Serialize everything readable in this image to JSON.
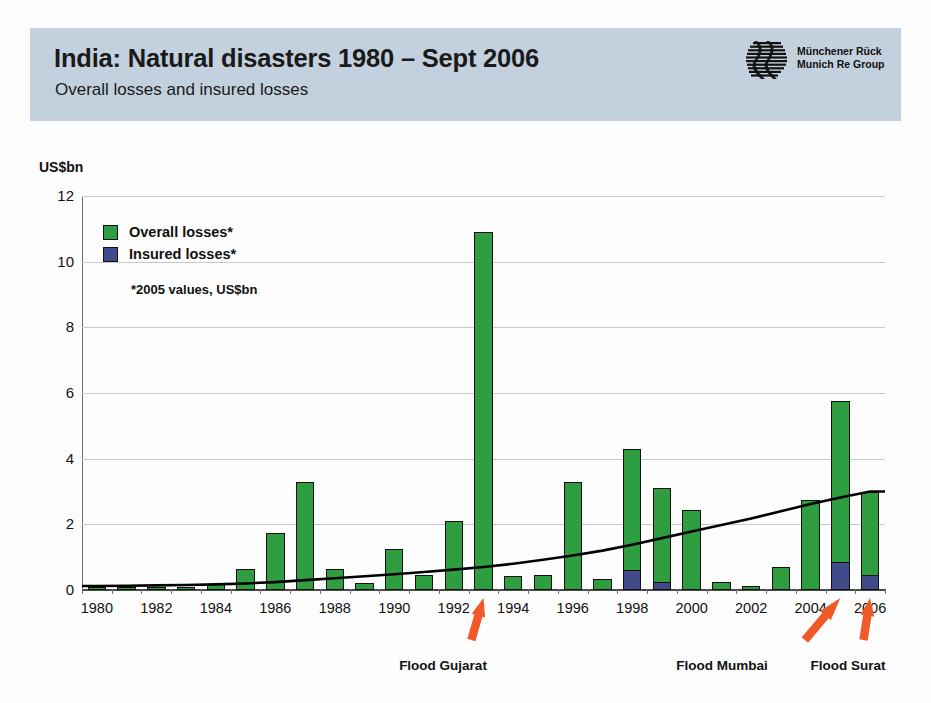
{
  "header": {
    "title": "India: Natural disasters 1980 – Sept 2006",
    "subtitle": "Overall losses and insured losses",
    "logo_line1": "Münchener Rück",
    "logo_line2": "Munich Re Group",
    "logo_icon": "munich-re-logo-icon",
    "band_color": "#c3d0de"
  },
  "legend": {
    "position": "inside-top-left",
    "items": [
      {
        "label": "Overall losses*",
        "color": "#2f9e41"
      },
      {
        "label": "Insured losses*",
        "color": "#414b8c"
      }
    ],
    "footnote": "*2005 values, US$bn"
  },
  "annotations": [
    {
      "label": "Flood Gujarat",
      "year": 1993,
      "color": "#f05a28"
    },
    {
      "label": "Flood Mumbai",
      "year": 2005,
      "color": "#f05a28"
    },
    {
      "label": "Flood Surat",
      "year": 2006,
      "color": "#f05a28"
    }
  ],
  "chart_data": {
    "type": "bar",
    "title": "India: Natural disasters 1980 – Sept 2006",
    "subtitle": "Overall losses and insured losses",
    "xlabel": "",
    "ylabel": "US$bn",
    "ylim": [
      0,
      12
    ],
    "yticks": [
      0,
      2,
      4,
      6,
      8,
      10,
      12
    ],
    "ytick_labels": [
      "0",
      "2",
      "4",
      "6",
      "8",
      "10",
      "12"
    ],
    "grid": true,
    "stacked": true,
    "categories": [
      1980,
      1981,
      1982,
      1983,
      1984,
      1985,
      1986,
      1987,
      1988,
      1989,
      1990,
      1991,
      1992,
      1993,
      1994,
      1995,
      1996,
      1997,
      1998,
      1999,
      2000,
      2001,
      2002,
      2003,
      2004,
      2005,
      2006
    ],
    "xtick_labels": [
      "1980",
      "1982",
      "1984",
      "1986",
      "1988",
      "1990",
      "1992",
      "1994",
      "1996",
      "1998",
      "2000",
      "2002",
      "2004",
      "2006"
    ],
    "series": [
      {
        "name": "Overall losses*",
        "color": "#2f9e41",
        "values": [
          0.06,
          0.05,
          0.05,
          0.05,
          0.18,
          0.65,
          1.75,
          3.3,
          0.65,
          0.22,
          1.25,
          0.45,
          2.1,
          10.9,
          0.42,
          0.45,
          3.3,
          0.33,
          4.3,
          3.1,
          2.45,
          0.25,
          0.12,
          0.7,
          2.75,
          5.75,
          3.0
        ]
      },
      {
        "name": "Insured losses*",
        "color": "#414b8c",
        "values": [
          0,
          0,
          0,
          0,
          0,
          0,
          0,
          0,
          0,
          0,
          0,
          0,
          0,
          0,
          0,
          0,
          0,
          0,
          0.6,
          0.25,
          0,
          0,
          0,
          0,
          0,
          0.85,
          0.45
        ]
      }
    ],
    "trend": {
      "name": "trend-line",
      "color": "#000000",
      "values": [
        0.12,
        0.13,
        0.14,
        0.15,
        0.17,
        0.2,
        0.24,
        0.3,
        0.36,
        0.42,
        0.48,
        0.55,
        0.62,
        0.7,
        0.8,
        0.92,
        1.05,
        1.2,
        1.38,
        1.58,
        1.78,
        1.98,
        2.18,
        2.4,
        2.62,
        2.82,
        3.0
      ]
    }
  }
}
